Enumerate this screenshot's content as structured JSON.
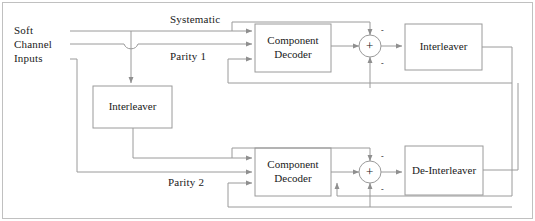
{
  "figure": {
    "stroke_color": "#9a9a9a",
    "text_color": "#1a1a1a",
    "background": "#ffffff",
    "border_color": "#b4b4b4"
  },
  "labels": {
    "input_line1": "Soft",
    "input_line2": "Channel",
    "input_line3": "Inputs",
    "systematic": "Systematic",
    "parity1": "Parity 1",
    "parity2": "Parity 2"
  },
  "blocks": {
    "interleaver_left": {
      "line1": "Interleaver"
    },
    "decoder_top": {
      "line1": "Component",
      "line2": "Decoder"
    },
    "interleaver_right": {
      "line1": "Interleaver"
    },
    "decoder_bottom": {
      "line1": "Component",
      "line2": "Decoder"
    },
    "deinterleaver": {
      "line1": "De-Interleaver"
    }
  },
  "adders": {
    "top": {
      "plus": "+",
      "minus_top": "-",
      "minus_bottom": "-"
    },
    "bottom": {
      "plus": "+",
      "minus_top": "-",
      "minus_bottom": "-"
    }
  }
}
